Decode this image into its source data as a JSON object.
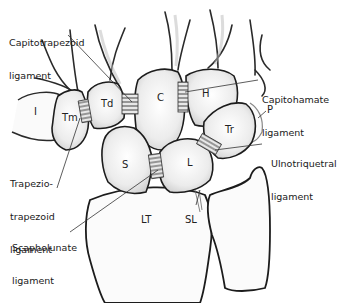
{
  "diagram": {
    "bones": [
      {
        "id": "I",
        "label": "I"
      },
      {
        "id": "Tm",
        "label": "Tm"
      },
      {
        "id": "Td",
        "label": "Td"
      },
      {
        "id": "C",
        "label": "C"
      },
      {
        "id": "H",
        "label": "H"
      },
      {
        "id": "P",
        "label": "P"
      },
      {
        "id": "Tr",
        "label": "Tr"
      },
      {
        "id": "S",
        "label": "S"
      },
      {
        "id": "L",
        "label": "L"
      },
      {
        "id": "LT",
        "label": "LT"
      },
      {
        "id": "SL",
        "label": "SL"
      }
    ],
    "callouts": [
      {
        "id": "capitotrapezoid",
        "line1": "Capitotrapezoid",
        "line2": "ligament"
      },
      {
        "id": "capitohamate",
        "line1": "Capitohamate",
        "line2": "ligament"
      },
      {
        "id": "ulnotriquetral",
        "line1": "Ulnotriquetral",
        "line2": "ligament"
      },
      {
        "id": "trapeziotrapezoid",
        "line1": "Trapezio-",
        "line2": "trapezoid",
        "line3": "ligament"
      },
      {
        "id": "scapholunate",
        "line1": "Scapholunate",
        "line2": "ligament"
      }
    ]
  }
}
